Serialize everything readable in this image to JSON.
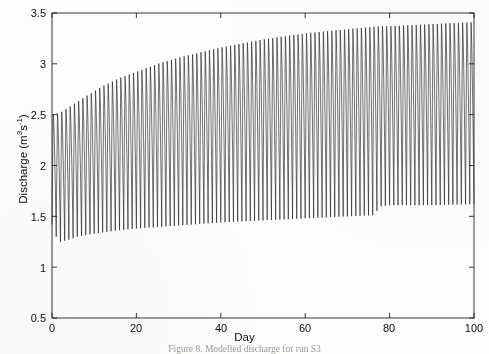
{
  "figure": {
    "caption": "Figure 8. Modelled discharge for run S3"
  },
  "axis": {
    "x_label": "Day",
    "y_label_prefix": "Discharge (m",
    "y_label_sup1": "3",
    "y_label_mid": "s",
    "y_label_sup2": "-1",
    "y_label_suffix": ")",
    "y_ticks": [
      "0.5",
      "1",
      "1.5",
      "2",
      "2.5",
      "3",
      "3.5"
    ],
    "x_ticks": [
      "0",
      "20",
      "40",
      "60",
      "80",
      "100"
    ]
  },
  "chart_data": {
    "type": "line",
    "title": "Figure 8. Modelled discharge for run S3",
    "xlabel": "Day",
    "ylabel": "Discharge (m3s-1)",
    "xlim": [
      0,
      100
    ],
    "ylim": [
      0.5,
      3.5
    ],
    "xticks": [
      0,
      20,
      40,
      60,
      80,
      100
    ],
    "yticks": [
      0.5,
      1,
      1.5,
      2,
      2.5,
      3,
      3.5
    ],
    "grid": false,
    "legend": null,
    "line_color": "#1a1a1a",
    "series": [
      {
        "name": "Discharge",
        "envelope_max": {
          "x": [
            0,
            2,
            5,
            8,
            12,
            16,
            20,
            25,
            30,
            35,
            40,
            45,
            50,
            55,
            60,
            65,
            70,
            75,
            78,
            80,
            85,
            90,
            95,
            100
          ],
          "y": [
            2.5,
            2.52,
            2.6,
            2.68,
            2.78,
            2.86,
            2.92,
            3.0,
            3.06,
            3.11,
            3.16,
            3.2,
            3.24,
            3.27,
            3.3,
            3.32,
            3.34,
            3.36,
            3.37,
            3.37,
            3.38,
            3.39,
            3.4,
            3.41
          ]
        },
        "envelope_min": {
          "x": [
            0,
            1,
            2,
            4,
            6,
            10,
            15,
            20,
            30,
            40,
            50,
            60,
            70,
            76,
            78,
            80,
            90,
            100
          ],
          "y": [
            1.42,
            1.3,
            1.25,
            1.27,
            1.3,
            1.33,
            1.36,
            1.38,
            1.41,
            1.44,
            1.46,
            1.48,
            1.5,
            1.51,
            1.6,
            1.61,
            1.61,
            1.62
          ]
        },
        "period_days": 1.0,
        "n_cycles": 100
      }
    ]
  },
  "geometry": {
    "plot_left": 52,
    "plot_right": 474,
    "plot_top": 13,
    "plot_bottom": 318
  }
}
